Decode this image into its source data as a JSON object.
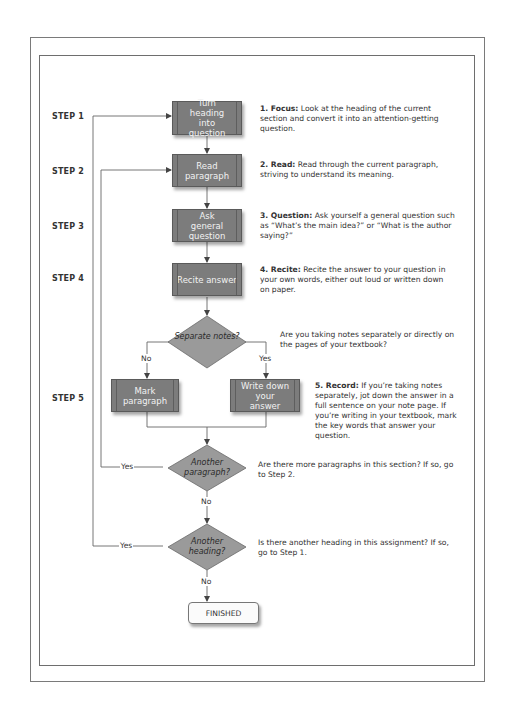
{
  "diagram": {
    "steps": [
      {
        "label": "STEP 1"
      },
      {
        "label": "STEP 2"
      },
      {
        "label": "STEP 3"
      },
      {
        "label": "STEP 4"
      },
      {
        "label": "STEP 5"
      }
    ],
    "process_boxes": {
      "turn_heading": "Turn heading into question",
      "read_paragraph": "Read paragraph",
      "ask_question": "Ask general question",
      "recite_answer": "Recite answer",
      "mark_paragraph": "Mark paragraph",
      "write_answer": "Write down your answer"
    },
    "decisions": {
      "separate_notes": "Separate notes?",
      "another_paragraph": "Another paragraph?",
      "another_heading": "Another heading?"
    },
    "edge_labels": {
      "no": "No",
      "yes": "Yes"
    },
    "terminal": "FINISHED",
    "descriptions": {
      "focus_title": "1. Focus:",
      "focus_text": "Look at the heading of the current section and convert it into an attention-getting question.",
      "read_title": "2. Read:",
      "read_text": "Read through the current paragraph, striving to understand its meaning.",
      "question_title": "3. Question:",
      "question_text": "Ask yourself a general question such as “What’s the main idea?” or “What is the author saying?”",
      "recite_title": "4. Recite:",
      "recite_text": "Recite the answer to your question in your own words, either out loud or written down on paper.",
      "separate_text": "Are you taking notes separately or directly on the pages of your textbook?",
      "record_title": "5. Record:",
      "record_text": "If you’re taking notes separately, jot down the answer in a full sentence on your note page. If you’re writing in your textbook, mark the key words that answer your question.",
      "paragraph_text": "Are there more paragraphs in this section? If so, go to Step 2.",
      "heading_text": "Is there another heading in this assignment? If so, go to Step 1."
    }
  }
}
